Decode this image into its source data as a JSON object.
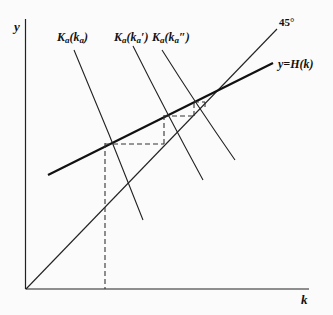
{
  "diagram": {
    "axes": {
      "y_label": "y",
      "x_label": "k"
    },
    "lines": {
      "diagonal_label": "45°",
      "h_curve_label": "y=H(k)"
    },
    "curves": [
      {
        "label_main": "K",
        "label_sub": "a",
        "label_arg": "(k",
        "label_arg_sub": "a",
        "label_prime": "",
        "label_close": ")"
      },
      {
        "label_main": "K",
        "label_sub": "a",
        "label_arg": "(k",
        "label_arg_sub": "a",
        "label_prime": "′",
        "label_close": ")"
      },
      {
        "label_main": "K",
        "label_sub": "a",
        "label_arg": "(k",
        "label_arg_sub": "a",
        "label_prime": "″",
        "label_close": ")"
      }
    ],
    "colors": {
      "line": "#1a1a1a",
      "background": "#fbfbfb"
    }
  }
}
